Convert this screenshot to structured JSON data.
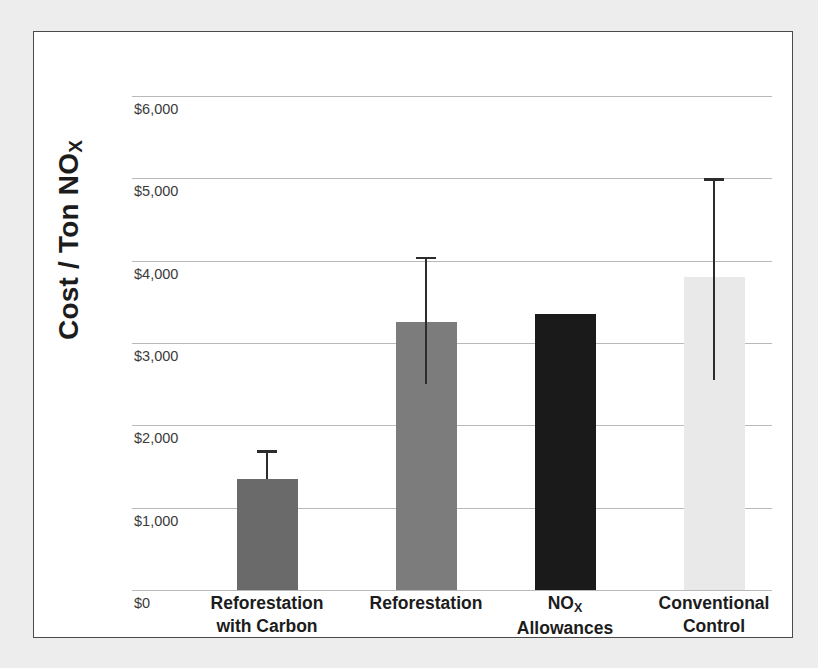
{
  "chart_data": {
    "type": "bar",
    "title": "",
    "subtitle": "",
    "xlabel": "",
    "ylabel": "Cost / Ton NO",
    "ylabel_subscript": "X",
    "categories": [
      "Reforestation\nwith Carbon",
      "Reforestation",
      "NOX\nAllowances",
      "Conventional\nControl"
    ],
    "category_lines": [
      [
        "Reforestation",
        "with Carbon"
      ],
      [
        "Reforestation",
        ""
      ],
      [
        "NO|X",
        "Allowances"
      ],
      [
        "Conventional",
        "Control"
      ]
    ],
    "values": [
      1350,
      3250,
      3350,
      3800
    ],
    "errors_upper": [
      1700,
      4050,
      null,
      5000
    ],
    "errors_lower": [
      1350,
      2500,
      null,
      2550
    ],
    "bar_colors": [
      "#6a6a6a",
      "#7c7c7c",
      "#1a1a1a",
      "#e9e9e9"
    ],
    "ylim": [
      0,
      6000
    ],
    "ytick_values": [
      0,
      1000,
      2000,
      3000,
      4000,
      5000,
      6000
    ],
    "ytick_labels": [
      "$0",
      "$1,000",
      "$2,000",
      "$3,000",
      "$4,000",
      "$5,000",
      "$6,000"
    ],
    "grid": true,
    "grid_color": "#b9b9b9",
    "legend": "none",
    "error_bar_color": "#2c2c2c",
    "frame_border_color": "#4a4a4a",
    "plot_background": "#ffffff",
    "page_background": "#ededed"
  }
}
